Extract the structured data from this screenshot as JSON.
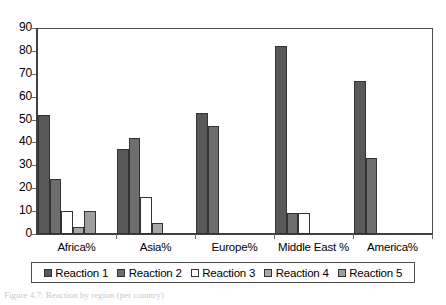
{
  "chart_data": {
    "type": "bar",
    "title": "",
    "xlabel": "",
    "ylabel": "",
    "ylim": [
      0,
      90
    ],
    "ytick_step": 10,
    "yticks": [
      "90",
      "80",
      "70",
      "60",
      "50",
      "40",
      "30",
      "20",
      "10",
      "0"
    ],
    "grid": false,
    "legend_position": "bottom",
    "categories": [
      "Africa%",
      "Asia%",
      "Europe%",
      "Middle East %",
      "America%"
    ],
    "series": [
      {
        "name": "Reaction 1",
        "color": "#595959",
        "values": [
          52,
          37,
          53,
          82,
          67
        ]
      },
      {
        "name": "Reaction 2",
        "color": "#6e6e6e",
        "values": [
          24,
          42,
          47,
          9,
          33
        ]
      },
      {
        "name": "Reaction 3",
        "color": "#ffffff",
        "values": [
          10,
          16,
          0,
          9,
          0
        ]
      },
      {
        "name": "Reaction 4",
        "color": "#a8a8a8",
        "values": [
          3,
          5,
          0,
          0,
          0
        ]
      },
      {
        "name": "Reaction 5",
        "color": "#9e9e9e",
        "values": [
          10,
          0,
          0,
          0,
          0
        ]
      }
    ]
  },
  "legend": {
    "items": [
      {
        "label": "Reaction 1",
        "color": "#595959"
      },
      {
        "label": "Reaction 2",
        "color": "#6e6e6e"
      },
      {
        "label": "Reaction 3",
        "color": "#ffffff"
      },
      {
        "label": "Reaction 4",
        "color": "#a8a8a8"
      },
      {
        "label": "Reaction 5",
        "color": "#9e9e9e"
      }
    ]
  },
  "caption": {
    "text": "Figure 4.7: Reaction by region (per country)"
  }
}
